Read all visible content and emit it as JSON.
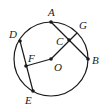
{
  "figure": {
    "type": "geometry-circle",
    "circle": {
      "center": "O",
      "cx": 51,
      "cy": 59,
      "r": 37
    },
    "points": [
      {
        "id": "A",
        "label": "A",
        "x": 51,
        "y": 22,
        "lx": 48,
        "ly": 16,
        "dot": true
      },
      {
        "id": "B",
        "label": "B",
        "x": 88,
        "y": 59,
        "lx": 92,
        "ly": 64,
        "dot": true
      },
      {
        "id": "C",
        "label": "C",
        "x": 69,
        "y": 40,
        "lx": 56,
        "ly": 45,
        "dot": true
      },
      {
        "id": "D",
        "label": "D",
        "x": 20,
        "y": 41,
        "lx": 9,
        "ly": 38,
        "dot": true
      },
      {
        "id": "E",
        "label": "E",
        "x": 33,
        "y": 91,
        "lx": 25,
        "ly": 104,
        "dot": true
      },
      {
        "id": "F",
        "label": "F",
        "x": 26,
        "y": 66,
        "lx": 28,
        "ly": 62,
        "dot": true
      },
      {
        "id": "G",
        "label": "G",
        "x": 77,
        "y": 33,
        "lx": 79,
        "ly": 29,
        "dot": false
      },
      {
        "id": "O",
        "label": "O",
        "x": 51,
        "y": 59,
        "lx": 54,
        "ly": 71,
        "dot": true
      }
    ],
    "segments": [
      {
        "from": "A",
        "to": "B"
      },
      {
        "from": "O",
        "to": "G"
      },
      {
        "from": "D",
        "to": "E"
      },
      {
        "from": "F",
        "to": "O"
      }
    ],
    "stroke_color": "#1a1a1a"
  }
}
